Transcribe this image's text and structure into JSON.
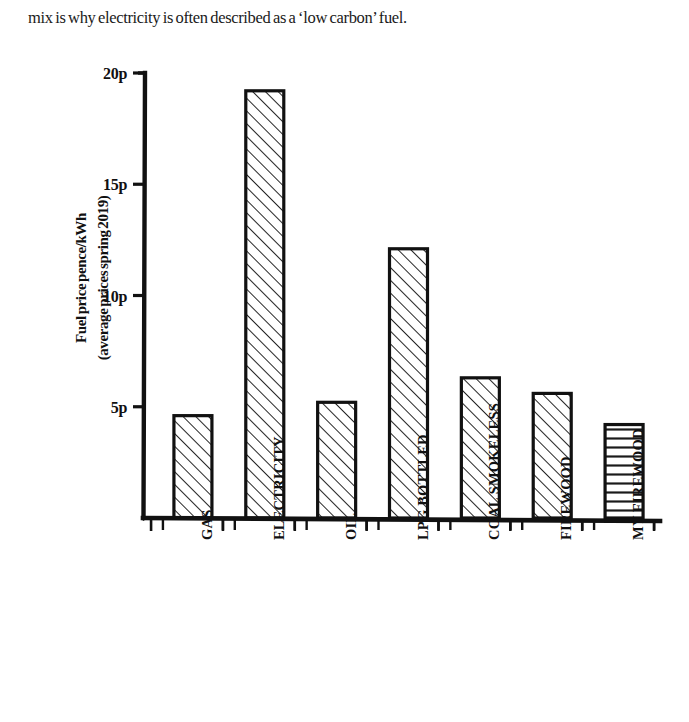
{
  "page": {
    "paragraph": "mix is why electricity is often described as a ‘low carbon’ fuel."
  },
  "chart_data": {
    "type": "bar",
    "title": "",
    "xlabel": "",
    "ylabel": "Fuel price pence/kWh\n(average prices spring 2019)",
    "categories": [
      "GAS",
      "ELECTRICITY",
      "OIL",
      "LPG BOTTLED",
      "COAL SMOKELESS",
      "FIREWOOD",
      "MY FIREWOOD"
    ],
    "values": [
      4.6,
      19.2,
      5.2,
      12.1,
      6.3,
      5.6,
      4.2
    ],
    "value_unit": "p",
    "ylim": [
      0,
      20
    ],
    "ytick_values": [
      5,
      10,
      15,
      20
    ],
    "ytick_labels": [
      "5p",
      "10p",
      "15p",
      "20p"
    ],
    "grid": false,
    "legend": false,
    "bar_fill_patterns": [
      "diagonal-hatch",
      "diagonal-hatch",
      "diagonal-hatch",
      "diagonal-hatch",
      "diagonal-hatch",
      "diagonal-hatch",
      "horizontal-hatch"
    ],
    "colors": {
      "ink": "#111111",
      "background": "#ffffff"
    },
    "style": "hand-drawn"
  }
}
